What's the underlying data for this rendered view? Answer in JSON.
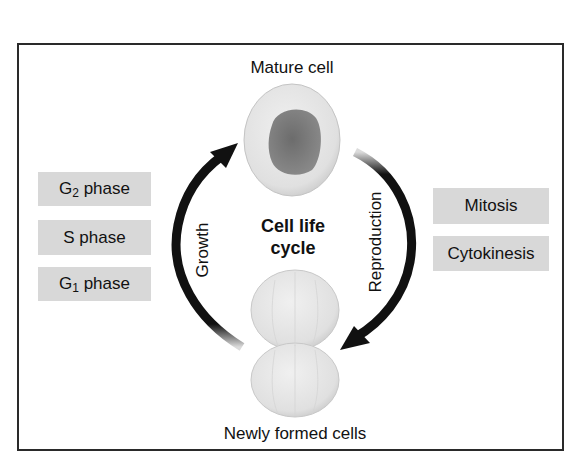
{
  "diagram": {
    "title_top": "Mature cell",
    "title_bottom": "Newly formed cells",
    "center_title_line1": "Cell life",
    "center_title_line2": "cycle",
    "arc_left_label": "Growth",
    "arc_right_label": "Reproduction",
    "growth_phases": [
      {
        "prefix": "G",
        "sub": "2",
        "suffix": " phase"
      },
      {
        "prefix": "S phase",
        "sub": "",
        "suffix": ""
      },
      {
        "prefix": "G",
        "sub": "1",
        "suffix": " phase"
      }
    ],
    "reproduction_phases": [
      "Mitosis",
      "Cytokinesis"
    ],
    "colors": {
      "box_fill": "#d8d8d8",
      "arrow": "#111111",
      "cell_fill": "#e4e4e4",
      "nucleus_fill": "#7a7a7a",
      "frame": "#2a2a2a"
    }
  }
}
